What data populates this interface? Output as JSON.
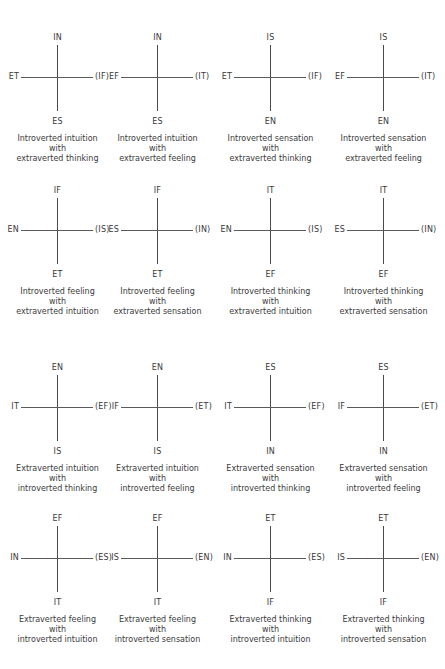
{
  "diagrams": [
    {
      "top": "IN",
      "left": "ET",
      "right": "(IF)",
      "bottom": "ES",
      "caption": [
        "Introverted intuition",
        "with",
        "extraverted thinking"
      ]
    },
    {
      "top": "IN",
      "left": "EF",
      "right": "(IT)",
      "bottom": "ES",
      "caption": [
        "Introverted intuition",
        "with",
        "extraverted feeling"
      ]
    },
    {
      "top": "IS",
      "left": "ET",
      "right": "(IF)",
      "bottom": "EN",
      "caption": [
        "Introverted sensation",
        "with",
        "extraverted thinking"
      ]
    },
    {
      "top": "IS",
      "left": "EF",
      "right": "(IT)",
      "bottom": "EN",
      "caption": [
        "Introverted sensation",
        "with",
        "extraverted feeling"
      ]
    },
    {
      "top": "IF",
      "left": "EN",
      "right": "(IS)",
      "bottom": "ET",
      "caption": [
        "Introverted feeling",
        "with",
        "extraverted intuition"
      ]
    },
    {
      "top": "IF",
      "left": "ES",
      "right": "(IN)",
      "bottom": "ET",
      "caption": [
        "Introverted feeling",
        "with",
        "extraverted sensation"
      ]
    },
    {
      "top": "IT",
      "left": "EN",
      "right": "(IS)",
      "bottom": "EF",
      "caption": [
        "Introverted thinking",
        "with",
        "extraverted intuition"
      ]
    },
    {
      "top": "IT",
      "left": "ES",
      "right": "(IN)",
      "bottom": "EF",
      "caption": [
        "Introverted thinking",
        "with",
        "extraverted sensation"
      ]
    },
    {
      "top": "EN",
      "left": "IT",
      "right": "(EF)",
      "bottom": "IS",
      "caption": [
        "Extraverted intuition",
        "with",
        "introverted thinking"
      ]
    },
    {
      "top": "EN",
      "left": "IF",
      "right": "(ET)",
      "bottom": "IS",
      "caption": [
        "Extraverted intuition",
        "with",
        "introverted feeling"
      ]
    },
    {
      "top": "ES",
      "left": "IT",
      "right": "(EF)",
      "bottom": "IN",
      "caption": [
        "Extraverted sensation",
        "with",
        "introverted thinking"
      ]
    },
    {
      "top": "ES",
      "left": "IF",
      "right": "(ET)",
      "bottom": "IN",
      "caption": [
        "Extraverted sensation",
        "with",
        "introverted feeling"
      ]
    },
    {
      "top": "EF",
      "left": "IN",
      "right": "(ES)",
      "bottom": "IT",
      "caption": [
        "Extraverted feeling",
        "with",
        "introverted intuition"
      ]
    },
    {
      "top": "EF",
      "left": "IS",
      "right": "(EN)",
      "bottom": "IT",
      "caption": [
        "Extraverted feeling",
        "with",
        "introverted sensation"
      ]
    },
    {
      "top": "ET",
      "left": "IN",
      "right": "(ES)",
      "bottom": "IF",
      "caption": [
        "Extraverted thinking",
        "with",
        "introverted intuition"
      ]
    },
    {
      "top": "ET",
      "left": "IS",
      "right": "(EN)",
      "bottom": "IF",
      "caption": [
        "Extraverted thinking",
        "with",
        "introverted sensation"
      ]
    }
  ]
}
